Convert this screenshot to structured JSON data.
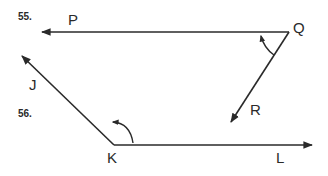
{
  "problems": [
    {
      "number": "55.",
      "vertex": "Q",
      "ray1": "P",
      "ray2": "R"
    },
    {
      "number": "56.",
      "vertex": "K",
      "ray1": "J",
      "ray2": "L"
    }
  ],
  "colors": {
    "stroke": "#2a2a2a",
    "background": "#ffffff"
  }
}
